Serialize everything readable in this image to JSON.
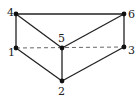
{
  "diagram": {
    "type": "graph",
    "nodes": [
      {
        "id": "1",
        "label": "1",
        "x": 16,
        "y": 48,
        "lx": 8,
        "ly": 56
      },
      {
        "id": "2",
        "label": "2",
        "x": 62,
        "y": 81,
        "lx": 58,
        "ly": 95
      },
      {
        "id": "3",
        "label": "3",
        "x": 124,
        "y": 47,
        "lx": 128,
        "ly": 54
      },
      {
        "id": "4",
        "label": "4",
        "x": 16,
        "y": 14,
        "lx": 7,
        "ly": 16
      },
      {
        "id": "5",
        "label": "5",
        "x": 62,
        "y": 48,
        "lx": 58,
        "ly": 42
      },
      {
        "id": "6",
        "label": "6",
        "x": 124,
        "y": 14,
        "lx": 128,
        "ly": 18
      }
    ],
    "edges": [
      {
        "from": "4",
        "to": "6",
        "style": "solid"
      },
      {
        "from": "4",
        "to": "1",
        "style": "solid"
      },
      {
        "from": "4",
        "to": "5",
        "style": "solid"
      },
      {
        "from": "6",
        "to": "5",
        "style": "solid"
      },
      {
        "from": "6",
        "to": "3",
        "style": "solid"
      },
      {
        "from": "1",
        "to": "2",
        "style": "solid"
      },
      {
        "from": "5",
        "to": "2",
        "style": "solid"
      },
      {
        "from": "3",
        "to": "2",
        "style": "solid"
      },
      {
        "from": "1",
        "to": "3",
        "style": "dashed"
      }
    ],
    "colors": {
      "line": "#222222",
      "node": "#111111",
      "dashed": "#555555"
    }
  }
}
